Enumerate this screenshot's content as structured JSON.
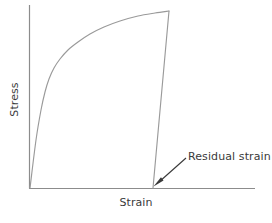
{
  "figure": {
    "axis_color": "#8c8c8c",
    "curve_color": "#9a9a9a",
    "text_color": "#3a3a3a",
    "background": "#ffffff"
  },
  "labels": {
    "x_axis": "Strain",
    "y_axis": "Stress",
    "annotation": "Residual strain"
  },
  "chart_data": {
    "type": "line",
    "title": "",
    "xlabel": "Strain",
    "ylabel": "Stress",
    "grid": false,
    "legend": null,
    "xlim": [
      0,
      1
    ],
    "ylim": [
      0,
      1
    ],
    "axes_pixel": {
      "origin_x": 29,
      "origin_y": 188,
      "x_axis_end_x": 255,
      "y_axis_top_y": 5
    },
    "annotations": [
      {
        "text": "Residual strain",
        "text_x": 188,
        "text_y": 155,
        "arrow_from_x": 186,
        "arrow_from_y": 158,
        "arrow_to_x": 154,
        "arrow_to_y": 186,
        "points_to": "residual-strain-intercept"
      }
    ],
    "series": [
      {
        "name": "loading-curve",
        "description": "Elastic-plastic stress-strain loading curve rising steeply then flattening toward peak",
        "points_pixel": [
          [
            30,
            188
          ],
          [
            36,
            140
          ],
          [
            41,
            110
          ],
          [
            45,
            92
          ],
          [
            49,
            79
          ],
          [
            54,
            68
          ],
          [
            60,
            59
          ],
          [
            68,
            50
          ],
          [
            78,
            42
          ],
          [
            90,
            34
          ],
          [
            104,
            27
          ],
          [
            120,
            21
          ],
          [
            138,
            16
          ],
          [
            155,
            13
          ],
          [
            169,
            11
          ]
        ]
      },
      {
        "name": "unloading-line",
        "description": "Straight elastic unloading line from peak stress back to zero stress, parallel to initial elastic slope",
        "points_pixel": [
          [
            169,
            11
          ],
          [
            153,
            188
          ]
        ]
      }
    ],
    "key_points": {
      "origin": [
        30,
        188
      ],
      "yield_knee": [
        50,
        78
      ],
      "peak": [
        169,
        11
      ],
      "residual_strain_intercept": [
        153,
        188
      ]
    }
  }
}
